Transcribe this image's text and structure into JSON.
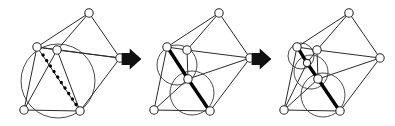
{
  "figure": {
    "type": "diagram",
    "panel_count": 3,
    "background_color": "#ffffff",
    "node_color": "#ffffff",
    "node_stroke_color": "#2b2b2b",
    "edge_color": "#2b2b2b",
    "circle_color": "#4a4a4a",
    "highlight_color": "#000000",
    "arrow_color": "#111111",
    "arrows": [
      {
        "name": "arrow-1",
        "label": "",
        "x": 131,
        "y": 59,
        "size": 13
      },
      {
        "name": "arrow-2",
        "label": "",
        "x": 261,
        "y": 59,
        "size": 13
      }
    ],
    "panels": [
      {
        "id": "panel-1",
        "label": "",
        "caption": "",
        "nodes": [
          {
            "id": "n-top",
            "cx": 89,
            "cy": 13,
            "r": 4.2
          },
          {
            "id": "n-upper-left",
            "cx": 37,
            "cy": 47,
            "r": 4.2
          },
          {
            "id": "n-upper-mid",
            "cx": 57,
            "cy": 50,
            "r": 4.2
          },
          {
            "id": "n-right",
            "cx": 120,
            "cy": 58,
            "r": 4.2
          },
          {
            "id": "n-lower-left",
            "cx": 24,
            "cy": 110,
            "r": 4.2
          },
          {
            "id": "n-lower-mid",
            "cx": 80,
            "cy": 111,
            "r": 4.2
          }
        ],
        "edges": [
          [
            "n-top",
            "n-upper-left"
          ],
          [
            "n-top",
            "n-upper-mid"
          ],
          [
            "n-top",
            "n-right"
          ],
          [
            "n-upper-left",
            "n-upper-mid"
          ],
          [
            "n-upper-left",
            "n-lower-left"
          ],
          [
            "n-upper-left",
            "n-lower-mid"
          ],
          [
            "n-upper-mid",
            "n-right"
          ],
          [
            "n-upper-mid",
            "n-lower-left"
          ],
          [
            "n-upper-mid",
            "n-lower-mid"
          ],
          [
            "n-right",
            "n-lower-mid"
          ],
          [
            "n-lower-left",
            "n-lower-mid"
          ],
          [
            "n-upper-left",
            "n-right"
          ]
        ],
        "circles": [
          {
            "id": "big-circumcircle",
            "cx": 58,
            "cy": 81,
            "r": 37
          }
        ],
        "highlights": [
          {
            "id": "flip-candidate-dotted",
            "style": "dotted",
            "x1": 43,
            "y1": 55,
            "x2": 79,
            "y2": 109
          }
        ]
      },
      {
        "id": "panel-2",
        "label": "",
        "caption": "",
        "nodes": [
          {
            "id": "n-top",
            "cx": 219,
            "cy": 13,
            "r": 4.2
          },
          {
            "id": "n-upper-left",
            "cx": 167,
            "cy": 47,
            "r": 4.2
          },
          {
            "id": "n-upper-mid",
            "cx": 187,
            "cy": 50,
            "r": 4.2
          },
          {
            "id": "n-right",
            "cx": 250,
            "cy": 58,
            "r": 4.2
          },
          {
            "id": "n-lower-left",
            "cx": 154,
            "cy": 110,
            "r": 4.2
          },
          {
            "id": "n-lower-mid",
            "cx": 210,
            "cy": 111,
            "r": 4.2
          },
          {
            "id": "n-center",
            "cx": 188,
            "cy": 79,
            "r": 4.2
          }
        ],
        "edges": [
          [
            "n-top",
            "n-upper-left"
          ],
          [
            "n-top",
            "n-upper-mid"
          ],
          [
            "n-top",
            "n-right"
          ],
          [
            "n-upper-left",
            "n-upper-mid"
          ],
          [
            "n-upper-left",
            "n-lower-left"
          ],
          [
            "n-upper-left",
            "n-center"
          ],
          [
            "n-upper-mid",
            "n-right"
          ],
          [
            "n-upper-mid",
            "n-center"
          ],
          [
            "n-right",
            "n-center"
          ],
          [
            "n-right",
            "n-lower-mid"
          ],
          [
            "n-lower-left",
            "n-center"
          ],
          [
            "n-lower-left",
            "n-lower-mid"
          ],
          [
            "n-lower-mid",
            "n-center"
          ]
        ],
        "circles": [
          {
            "id": "circumcircle-upper",
            "cx": 177,
            "cy": 65,
            "r": 20
          },
          {
            "id": "circumcircle-lower",
            "cx": 192,
            "cy": 93,
            "r": 22
          }
        ],
        "highlights": [
          {
            "id": "flipped-edge-upper",
            "style": "solid",
            "x1": 168,
            "y1": 48,
            "x2": 188,
            "y2": 79
          },
          {
            "id": "flipped-edge-lower",
            "style": "solid",
            "x1": 188,
            "y1": 79,
            "x2": 209,
            "y2": 110
          }
        ]
      },
      {
        "id": "panel-3",
        "label": "",
        "caption": "",
        "nodes": [
          {
            "id": "n-top",
            "cx": 349,
            "cy": 13,
            "r": 4.2
          },
          {
            "id": "n-upper-left",
            "cx": 297,
            "cy": 47,
            "r": 4.2
          },
          {
            "id": "n-upper-mid",
            "cx": 317,
            "cy": 50,
            "r": 4.2
          },
          {
            "id": "n-right",
            "cx": 380,
            "cy": 58,
            "r": 4.2
          },
          {
            "id": "n-lower-left",
            "cx": 284,
            "cy": 110,
            "r": 4.2
          },
          {
            "id": "n-lower-mid",
            "cx": 340,
            "cy": 111,
            "r": 4.2
          },
          {
            "id": "n-center",
            "cx": 318,
            "cy": 79,
            "r": 4.2
          },
          {
            "id": "n-mid-small",
            "cx": 307,
            "cy": 63,
            "r": 3.6
          }
        ],
        "edges": [
          [
            "n-top",
            "n-upper-left"
          ],
          [
            "n-top",
            "n-upper-mid"
          ],
          [
            "n-top",
            "n-right"
          ],
          [
            "n-upper-left",
            "n-upper-mid"
          ],
          [
            "n-upper-left",
            "n-lower-left"
          ],
          [
            "n-upper-left",
            "n-mid-small"
          ],
          [
            "n-upper-mid",
            "n-right"
          ],
          [
            "n-upper-mid",
            "n-mid-small"
          ],
          [
            "n-upper-mid",
            "n-center"
          ],
          [
            "n-right",
            "n-center"
          ],
          [
            "n-right",
            "n-lower-mid"
          ],
          [
            "n-mid-small",
            "n-center"
          ],
          [
            "n-mid-small",
            "n-lower-left"
          ],
          [
            "n-lower-left",
            "n-center"
          ],
          [
            "n-lower-left",
            "n-lower-mid"
          ],
          [
            "n-lower-mid",
            "n-center"
          ]
        ],
        "circles": [
          {
            "id": "circumcircle-small",
            "cx": 301,
            "cy": 56,
            "r": 13
          },
          {
            "id": "circumcircle-middle",
            "cx": 311,
            "cy": 72,
            "r": 17
          },
          {
            "id": "circumcircle-large",
            "cx": 323,
            "cy": 95,
            "r": 22
          }
        ],
        "highlights": [
          {
            "id": "flipped-edge-top",
            "style": "solid",
            "x1": 298,
            "y1": 48,
            "x2": 307,
            "y2": 63
          },
          {
            "id": "flipped-edge-middle",
            "style": "solid",
            "x1": 307,
            "y1": 63,
            "x2": 318,
            "y2": 79
          },
          {
            "id": "flipped-edge-bottom",
            "style": "solid",
            "x1": 318,
            "y1": 79,
            "x2": 339,
            "y2": 110
          }
        ]
      }
    ]
  }
}
